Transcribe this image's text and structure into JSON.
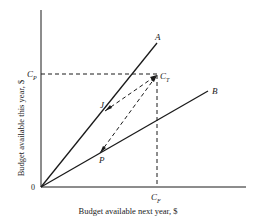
{
  "figure": {
    "x_axis_label": "Budget available next year, $",
    "y_axis_label": "Budget available this year, $",
    "origin_label": "0",
    "points": {
      "A": {
        "label": "A"
      },
      "B": {
        "label": "B"
      },
      "J": {
        "label": "J"
      },
      "P": {
        "label": "P"
      },
      "CT": {
        "label": "C",
        "sub": "T"
      },
      "CP": {
        "label": "C",
        "sub": "P"
      },
      "CF": {
        "label": "C",
        "sub": "F"
      }
    },
    "colors": {
      "ink": "#1a1a1a",
      "background": "#ffffff"
    }
  }
}
